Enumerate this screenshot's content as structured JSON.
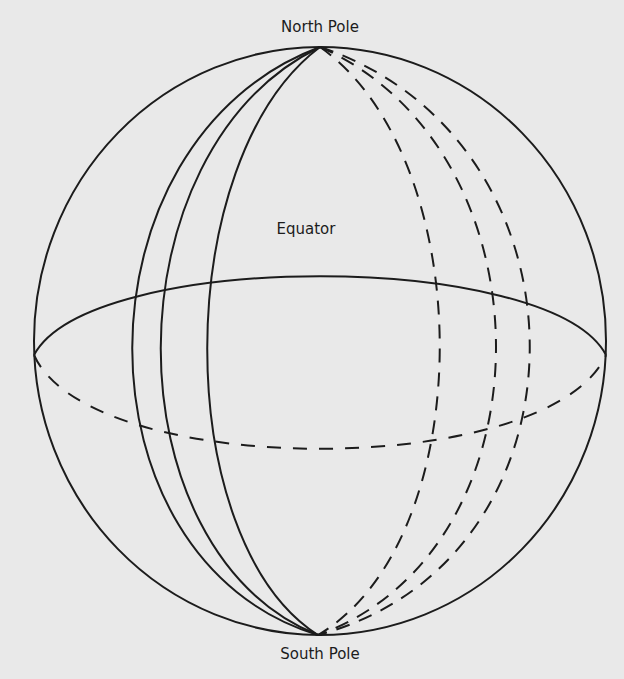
{
  "labels": {
    "north_pole": "North Pole",
    "equator": "Equator",
    "south_pole": "South Pole"
  },
  "colors": {
    "background": "#e9e9e9",
    "ink": "#1c1c1c"
  },
  "figure": {
    "solid_meridians": 3,
    "dashed_meridians": 3
  }
}
